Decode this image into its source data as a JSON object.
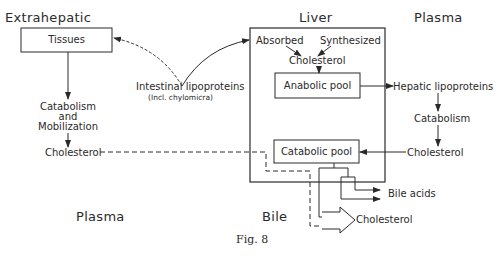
{
  "regions": {
    "extrahepatic": "Extrahepatic",
    "liver": "Liver",
    "plasma_top": "Plasma",
    "plasma_bottom": "Plasma",
    "bile": "Bile"
  },
  "nodes": {
    "tissues": "Tissues",
    "catabolism_left_1": "Catabolism",
    "catabolism_left_2": "and",
    "catabolism_left_3": "Mobilization",
    "cholesterol_left": "Cholesterol",
    "intestinal_lipoproteins": "Intestinal lipoproteins",
    "intestinal_note": "(Incl. chylomicra)",
    "absorbed": "Absorbed",
    "synthesized": "Synthesized",
    "cholesterol_liver": "Cholesterol",
    "anabolic_pool": "Anabolic pool",
    "catabolic_pool": "Catabolic pool",
    "hepatic_lipoproteins": "Hepatic lipoproteins",
    "catabolism_right": "Catabolism",
    "cholesterol_right": "Cholesterol",
    "bile_acids": "Bile acids",
    "cholesterol_bile": "Cholesterol"
  },
  "caption": "Fig. 8",
  "colors": {
    "line": "#2a2a2a",
    "background": "#ffffff"
  }
}
